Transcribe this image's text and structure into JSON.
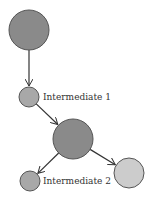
{
  "diagram": {
    "nodes": [
      {
        "id": "n1",
        "label": "",
        "cx": 29,
        "cy": 30,
        "r": 20,
        "fill": "#8a8a8a"
      },
      {
        "id": "n2",
        "label": "Intermediate 1",
        "cx": 29,
        "cy": 97,
        "r": 10,
        "fill": "#a8a8a8"
      },
      {
        "id": "n3",
        "label": "",
        "cx": 73,
        "cy": 139,
        "r": 20,
        "fill": "#8a8a8a"
      },
      {
        "id": "n4",
        "label": "Intermediate 2",
        "cx": 30,
        "cy": 181,
        "r": 10,
        "fill": "#a8a8a8"
      },
      {
        "id": "n5",
        "label": "",
        "cx": 129,
        "cy": 173,
        "r": 15,
        "fill": "#cccccc"
      }
    ],
    "edges": [
      {
        "from": "n1",
        "to": "n2"
      },
      {
        "from": "n2",
        "to": "n3"
      },
      {
        "from": "n3",
        "to": "n4"
      },
      {
        "from": "n3",
        "to": "n5"
      }
    ]
  }
}
